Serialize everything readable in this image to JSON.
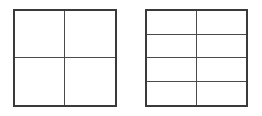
{
  "figure": {
    "background_color": "#ffffff",
    "stroke_color": "#3a3a3a",
    "inner_stroke_color": "#4a4a4a",
    "outer_stroke_width_px": 2,
    "inner_stroke_width_px": 1,
    "canvas": {
      "width": 262,
      "height": 116
    },
    "shapes": [
      {
        "name": "left-square",
        "label": "Square partitioned into 4 equal parts",
        "x": 13,
        "y": 9,
        "width": 104,
        "height": 98,
        "columns": 2,
        "rows": 2,
        "cell_count": 4,
        "vertical_dividers": [
          64
        ],
        "horizontal_dividers": [
          58
        ],
        "cells": [
          {
            "name": "cell-r1c1",
            "shaded": false
          },
          {
            "name": "cell-r1c2",
            "shaded": false
          },
          {
            "name": "cell-r2c1",
            "shaded": false
          },
          {
            "name": "cell-r2c2",
            "shaded": false
          }
        ]
      },
      {
        "name": "right-square",
        "label": "Square partitioned into 8 equal parts",
        "x": 145,
        "y": 9,
        "width": 103,
        "height": 98,
        "columns": 2,
        "rows": 4,
        "cell_count": 8,
        "vertical_dividers": [
          196
        ],
        "horizontal_dividers": [
          34,
          58,
          82
        ],
        "cells": [
          {
            "name": "cell-r1c1",
            "shaded": false
          },
          {
            "name": "cell-r1c2",
            "shaded": false
          },
          {
            "name": "cell-r2c1",
            "shaded": false
          },
          {
            "name": "cell-r2c2",
            "shaded": false
          },
          {
            "name": "cell-r3c1",
            "shaded": false
          },
          {
            "name": "cell-r3c2",
            "shaded": false
          },
          {
            "name": "cell-r4c1",
            "shaded": false
          },
          {
            "name": "cell-r4c2",
            "shaded": false
          }
        ]
      }
    ]
  }
}
